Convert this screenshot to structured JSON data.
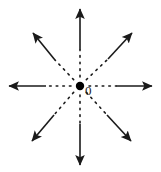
{
  "figure": {
    "type": "radial-ray-diagram",
    "title": "",
    "background_color": "#ffffff",
    "stroke_color": "#1a1a1a",
    "width": 161,
    "height": 172,
    "origin": {
      "label": "0",
      "x": 80,
      "y": 86,
      "dot_radius": 4.2,
      "dot_color": "#000000",
      "label_offset_x": 5,
      "label_offset_y": -2
    },
    "ray_style": {
      "inner_segment": "dotted",
      "outer_segment": "solid",
      "arrowhead": "filled-triangle",
      "line_width": 1.6,
      "dot_pattern": "1.6 5",
      "dot_start_radius": 9,
      "dot_end_radius": 40
    },
    "rays": [
      {
        "name": "ray-north",
        "direction": "up",
        "angle_deg": 90,
        "tip_x": 80,
        "tip_y": 9,
        "solid_start_x": 80,
        "solid_start_y": 50
      },
      {
        "name": "ray-northeast",
        "direction": "up-right",
        "angle_deg": 45,
        "tip_x": 132,
        "tip_y": 33,
        "solid_start_x": 108,
        "solid_start_y": 59
      },
      {
        "name": "ray-east",
        "direction": "right",
        "angle_deg": 0,
        "tip_x": 152,
        "tip_y": 86,
        "solid_start_x": 116,
        "solid_start_y": 86
      },
      {
        "name": "ray-southeast",
        "direction": "down-right",
        "angle_deg": -45,
        "tip_x": 131,
        "tip_y": 141,
        "solid_start_x": 107,
        "solid_start_y": 115
      },
      {
        "name": "ray-south",
        "direction": "down",
        "angle_deg": -90,
        "tip_x": 80,
        "tip_y": 165,
        "solid_start_x": 80,
        "solid_start_y": 124
      },
      {
        "name": "ray-southwest",
        "direction": "down-left",
        "angle_deg": -135,
        "tip_x": 32,
        "tip_y": 141,
        "solid_start_x": 54,
        "solid_start_y": 115
      },
      {
        "name": "ray-west",
        "direction": "left",
        "angle_deg": 180,
        "tip_x": 9,
        "tip_y": 86,
        "solid_start_x": 46,
        "solid_start_y": 86
      },
      {
        "name": "ray-northwest",
        "direction": "up-left",
        "angle_deg": 135,
        "tip_x": 33,
        "tip_y": 33,
        "solid_start_x": 55,
        "solid_start_y": 60
      }
    ]
  }
}
